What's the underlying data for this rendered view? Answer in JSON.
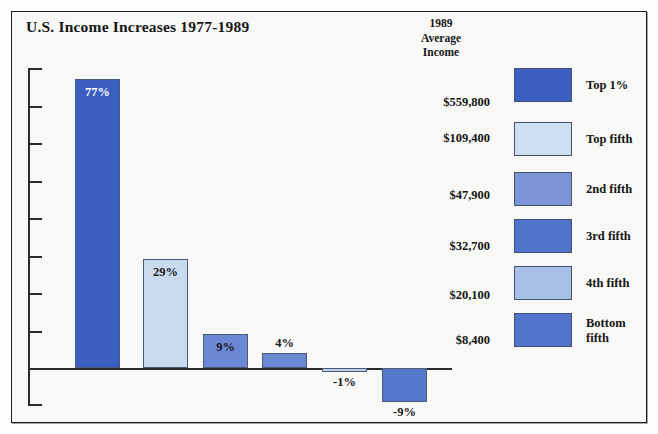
{
  "frame": {
    "border_color": "#1c1c1c",
    "background": "#f8f8f6"
  },
  "title": "U.S. Income Increases 1977-1989",
  "column_header": "1989\nAverage\nIncome",
  "chart_data": {
    "type": "bar",
    "title": "U.S. Income Increases 1977-1989",
    "xlabel": "",
    "ylabel": "",
    "ylim": [
      -20,
      80
    ],
    "grid": false,
    "legend_position": "right",
    "categories": [
      "Top 1%",
      "Top fifth",
      "2nd fifth",
      "3rd fifth",
      "4th fifth",
      "Bottom fifth"
    ],
    "values": [
      77,
      29,
      9,
      4,
      -1,
      -9
    ],
    "value_labels": [
      "77%",
      "29%",
      "9%",
      "4%",
      "-1%",
      "-9%"
    ],
    "bar_colors": [
      "#3a5fc0",
      "#c9daef",
      "#6c88d2",
      "#6c88d2",
      "#b9cce8",
      "#5578cb"
    ],
    "annotations": {
      "column_header": "1989 Average Income",
      "income_values": [
        "$559,800",
        "$109,400",
        "$47,900",
        "$32,700",
        "$20,100",
        "$8,400"
      ]
    }
  },
  "legend": {
    "items": [
      {
        "label": "Top 1%",
        "color": "#3a5fc0",
        "income": "$559,800"
      },
      {
        "label": "Top fifth",
        "color": "#cfdef1",
        "income": "$109,400"
      },
      {
        "label": "2nd fifth",
        "color": "#7b95d8",
        "income": "$47,900"
      },
      {
        "label": "3rd fifth",
        "color": "#4e73c8",
        "income": "$32,700"
      },
      {
        "label": "4th fifth",
        "color": "#a8c0e6",
        "income": "$20,100"
      },
      {
        "label": "Bottom fifth",
        "color": "#4f74c9",
        "income": "$8,400"
      }
    ]
  },
  "axis": {
    "baseline_value": "0",
    "tick_count_above": 8,
    "tick_count_below": 1
  }
}
